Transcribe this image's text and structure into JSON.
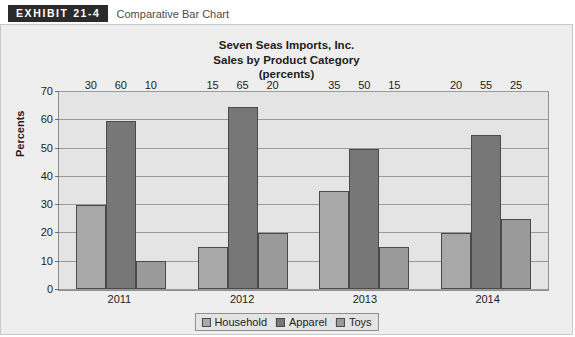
{
  "exhibit": {
    "tag": "EXHIBIT 21-4",
    "caption": "Comparative Bar Chart"
  },
  "chart_data": {
    "type": "bar",
    "title": "Seven Seas Imports, Inc.\nSales by Product Category\n(percents)",
    "title_lines": [
      "Seven Seas Imports, Inc.",
      "Sales by Product Category",
      "(percents)"
    ],
    "xlabel": "",
    "ylabel": "Percents",
    "ylim": [
      0,
      70
    ],
    "ytick_step": 10,
    "yticks": [
      70,
      60,
      50,
      40,
      30,
      20,
      10,
      0
    ],
    "ytick_labels": [
      "70",
      "60",
      "50",
      "40",
      "30",
      "20",
      "10",
      "0"
    ],
    "categories": [
      "2011",
      "2012",
      "2013",
      "2014"
    ],
    "grid": true,
    "grid_axis": "y",
    "legend_position": "bottom",
    "series": [
      {
        "name": "Household",
        "color": "#a8a8a8",
        "values": [
          30,
          15,
          35,
          20
        ],
        "labels": [
          "30",
          "15",
          "35",
          "20"
        ]
      },
      {
        "name": "Apparel",
        "color": "#777777",
        "values": [
          60,
          65,
          50,
          55
        ],
        "labels": [
          "60",
          "65",
          "50",
          "55"
        ]
      },
      {
        "name": "Toys",
        "color": "#9a9a9a",
        "values": [
          10,
          20,
          15,
          25
        ],
        "labels": [
          "10",
          "20",
          "15",
          "25"
        ]
      }
    ]
  },
  "colors": {
    "panel_background": "#eeeeee",
    "plot_background": "#e4e4e4",
    "gridline": "#9a9a9a",
    "axis": "#8f8f8f",
    "bar_border": "#4a4a4a",
    "text": "#1d1d1d",
    "tag_background": "#2b2b2b",
    "tag_text": "#ffffff"
  }
}
